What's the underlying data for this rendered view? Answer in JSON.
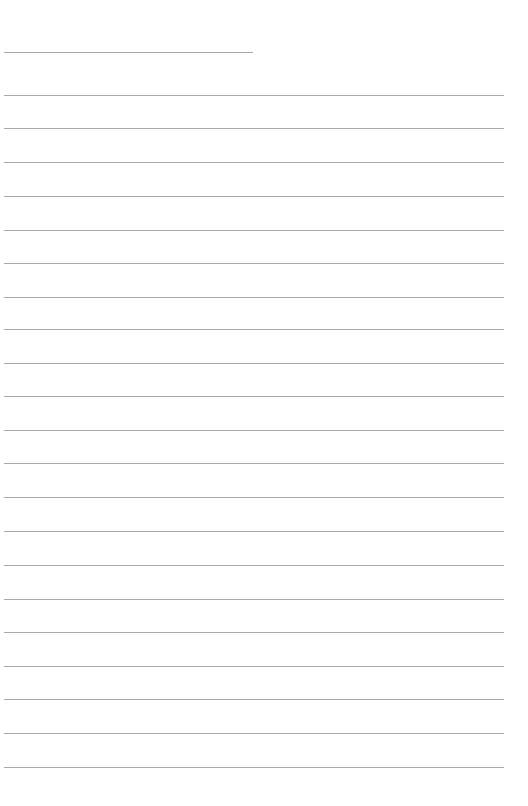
{
  "page": {
    "type": "blank-lined-paper",
    "background_color": "#ffffff",
    "line_color": "#9a9a9a",
    "header_line": {
      "x_start": 4,
      "x_end": 253,
      "y": 52
    },
    "ruled_lines": {
      "x_start": 4,
      "x_end": 504,
      "y_positions": [
        95,
        128,
        162,
        196,
        230,
        263,
        297,
        329,
        363,
        396,
        430,
        463,
        497,
        531,
        565,
        599,
        632,
        666,
        699,
        733,
        767
      ]
    }
  }
}
